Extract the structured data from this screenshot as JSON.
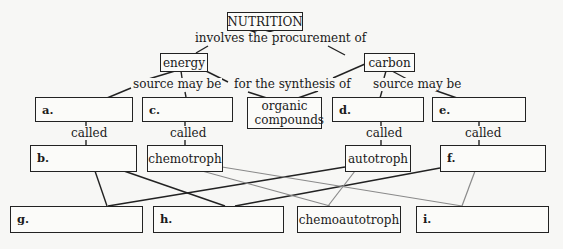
{
  "title_node": "NUTRITION",
  "links": {
    "procurement": "involves the procurement of",
    "energy_source": "source may be",
    "synthesis": "for the synthesis of",
    "carbon_source": "source may be",
    "called_a": "called",
    "called_c": "called",
    "called_d": "called",
    "called_e": "called"
  },
  "nodes": {
    "energy": "energy",
    "carbon": "carbon",
    "organic_compounds": "organic compounds",
    "chemotroph": "chemotroph",
    "autotroph": "autotroph",
    "chemoautotroph": "chemoautotroph"
  },
  "blanks": {
    "a": {
      "letter": "a.",
      "value": ""
    },
    "b": {
      "letter": "b.",
      "value": ""
    },
    "c": {
      "letter": "c.",
      "value": ""
    },
    "d": {
      "letter": "d.",
      "value": ""
    },
    "e": {
      "letter": "e.",
      "value": ""
    },
    "f": {
      "letter": "f.",
      "value": ""
    },
    "g": {
      "letter": "g.",
      "value": ""
    },
    "h": {
      "letter": "h.",
      "value": ""
    },
    "i": {
      "letter": "i.",
      "value": ""
    }
  },
  "colors": {
    "dark_line": "#222222",
    "gray_line": "#8a8a8a",
    "background": "#f7f7f5"
  }
}
